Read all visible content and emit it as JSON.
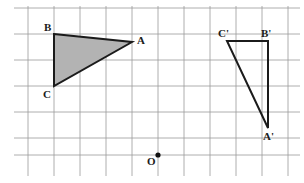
{
  "figure": {
    "width": 304,
    "height": 183,
    "background_color": "#ffffff"
  },
  "grid": {
    "line_color": "#9a9a9a",
    "line_width": 0.8,
    "cell_size": 26,
    "x_lines": [
      28,
      54,
      80,
      106,
      132,
      158,
      184,
      210,
      236,
      262,
      288
    ],
    "y_lines": [
      8,
      34,
      60,
      86,
      112,
      138,
      155
    ],
    "x_extent": [
      14,
      300
    ],
    "y_extent": [
      6,
      176
    ]
  },
  "shapes": {
    "triangle_original": {
      "name": "triangle-ABC",
      "fill_color": "#b3b3b3",
      "stroke_color": "#1b1b1b",
      "stroke_width": 2,
      "vertices": [
        {
          "id": "B",
          "label": "B",
          "x": 54,
          "y": 34
        },
        {
          "id": "A",
          "label": "A",
          "x": 132,
          "y": 42
        },
        {
          "id": "C",
          "label": "C",
          "x": 54,
          "y": 86
        }
      ]
    },
    "triangle_image": {
      "name": "triangle-C-prime-B-prime-A-prime",
      "fill_color": "none",
      "stroke_color": "#1b1b1b",
      "stroke_width": 2,
      "vertices": [
        {
          "id": "Cp",
          "label": "C'",
          "x": 227,
          "y": 41
        },
        {
          "id": "Bp",
          "label": "B'",
          "x": 268,
          "y": 41
        },
        {
          "id": "Ap",
          "label": "A'",
          "x": 268,
          "y": 128
        }
      ]
    },
    "origin_point": {
      "name": "point-O",
      "label": "O",
      "x": 158,
      "y": 155,
      "radius": 2.6,
      "color": "#111111"
    }
  },
  "labels": [
    {
      "id": "label-B",
      "text": "B",
      "x": 44,
      "y": 22
    },
    {
      "id": "label-A",
      "text": "A",
      "x": 137,
      "y": 35
    },
    {
      "id": "label-C",
      "text": "C",
      "x": 43,
      "y": 89
    },
    {
      "id": "label-Cp",
      "text": "C'",
      "x": 218,
      "y": 28
    },
    {
      "id": "label-Bp",
      "text": "B'",
      "x": 261,
      "y": 28
    },
    {
      "id": "label-Ap",
      "text": "A'",
      "x": 263,
      "y": 131
    },
    {
      "id": "label-O",
      "text": "O",
      "x": 147,
      "y": 156
    }
  ]
}
